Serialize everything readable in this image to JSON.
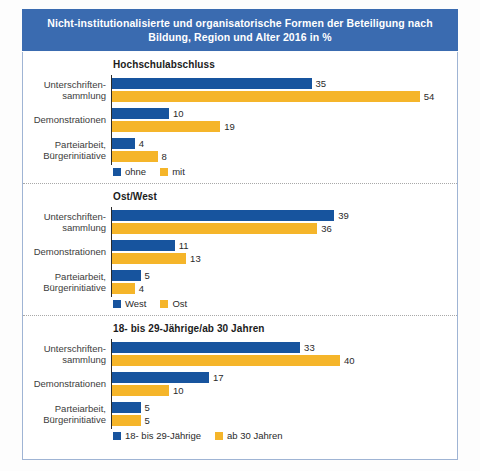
{
  "title": "Nicht-institutionalisierte und organisatorische Formen der Beteiligung nach Bildung, Region und Alter 2016 in %",
  "colors": {
    "series0": "#17549e",
    "series1": "#f5b52a",
    "title_bar": "#3a6bb0",
    "card_border": "#9fb4d4",
    "divider": "#a8a8a8"
  },
  "chart_data": [
    {
      "type": "bar",
      "title": "Hochschulabschluss",
      "orientation": "horizontal",
      "categories": [
        "Unterschriften-\nsammlung",
        "Demonstrationen",
        "Parteiarbeit,\nBürgerinitiative"
      ],
      "series": [
        {
          "name": "ohne",
          "values": [
            35,
            10,
            4
          ],
          "color": "#17549e"
        },
        {
          "name": "mit",
          "values": [
            54,
            19,
            8
          ],
          "color": "#f5b52a"
        }
      ],
      "xlabel": "",
      "ylabel": "",
      "xlim": [
        0,
        60
      ],
      "grid": false,
      "legend_position": "bottom"
    },
    {
      "type": "bar",
      "title": "Ost/West",
      "orientation": "horizontal",
      "categories": [
        "Unterschriften-\nsammlung",
        "Demonstrationen",
        "Parteiarbeit,\nBürgerinitiative"
      ],
      "series": [
        {
          "name": "West",
          "values": [
            39,
            11,
            5
          ],
          "color": "#17549e"
        },
        {
          "name": "Ost",
          "values": [
            36,
            13,
            4
          ],
          "color": "#f5b52a"
        }
      ],
      "xlabel": "",
      "ylabel": "",
      "xlim": [
        0,
        60
      ],
      "grid": false,
      "legend_position": "bottom"
    },
    {
      "type": "bar",
      "title": "18- bis 29-Jährige/ab 30 Jahren",
      "orientation": "horizontal",
      "categories": [
        "Unterschriften-\nsammlung",
        "Demonstrationen",
        "Parteiarbeit,\nBürgerinitiative"
      ],
      "series": [
        {
          "name": "18- bis 29-Jährige",
          "values": [
            33,
            17,
            5
          ],
          "color": "#17549e"
        },
        {
          "name": "ab 30 Jahren",
          "values": [
            40,
            10,
            5
          ],
          "color": "#f5b52a"
        }
      ],
      "xlabel": "",
      "ylabel": "",
      "xlim": [
        0,
        60
      ],
      "grid": false,
      "legend_position": "bottom"
    }
  ]
}
